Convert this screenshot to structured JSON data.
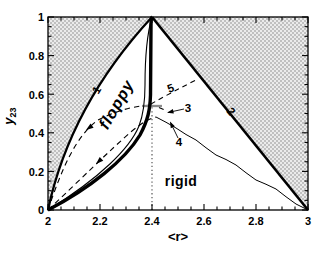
{
  "figure": {
    "xlabel": "<r>",
    "ylabel": {
      "base": "y",
      "sub": "23"
    },
    "x_ticks": [
      "2",
      "2.2",
      "2.4",
      "2.6",
      "2.8",
      "3"
    ],
    "y_ticks": [
      "1",
      "0.8",
      "0.6",
      "0.4",
      "0.2",
      "0"
    ],
    "regions": {
      "floppy": "floppy",
      "rigid": "rigid"
    },
    "curve_labels": {
      "c1": "1",
      "c2": "2",
      "c3": "3",
      "c4": "4",
      "c5": "5"
    }
  },
  "chart_data": {
    "type": "line",
    "title": "",
    "xlabel": "<r>",
    "ylabel": "y_23",
    "xlim": [
      2,
      3
    ],
    "ylim": [
      0,
      1
    ],
    "x_major_ticks": [
      2,
      2.2,
      2.4,
      2.6,
      2.8,
      3
    ],
    "y_major_ticks": [
      0,
      0.2,
      0.4,
      0.6,
      0.8,
      1
    ],
    "minor_tick_step": 0.05,
    "background": "stippled (dotted halftone) everywhere outside the triangular phase region",
    "regions": [
      {
        "label": "floppy",
        "at": [
          2.28,
          0.55
        ],
        "rotation_deg": -60
      },
      {
        "label": "rigid",
        "at": [
          2.52,
          0.16
        ],
        "rotation_deg": 0
      }
    ],
    "reference_line": {
      "style": "dotted-vertical",
      "x": 2.4,
      "y_from": 0,
      "y_to": 0.55
    },
    "series": [
      {
        "name": "1",
        "style": "thick solid boundary (left edge of stippled region)",
        "points": [
          [
            2.0,
            0
          ],
          [
            2.03,
            0.1
          ],
          [
            2.08,
            0.31
          ],
          [
            2.12,
            0.42
          ],
          [
            2.19,
            0.57
          ],
          [
            2.24,
            0.7
          ],
          [
            2.33,
            0.88
          ],
          [
            2.4,
            1.0
          ]
        ]
      },
      {
        "name": "2",
        "style": "thick solid boundary (right edge of stippled region)",
        "points": [
          [
            2.4,
            1.0
          ],
          [
            3.0,
            0
          ]
        ]
      },
      {
        "name": "transition-thick",
        "style": "heavy solid curve, becomes vertical near r=2.4",
        "points": [
          [
            2.0,
            0
          ],
          [
            2.09,
            0.06
          ],
          [
            2.16,
            0.13
          ],
          [
            2.24,
            0.21
          ],
          [
            2.3,
            0.28
          ],
          [
            2.33,
            0.35
          ],
          [
            2.37,
            0.41
          ],
          [
            2.38,
            0.47
          ],
          [
            2.39,
            0.55
          ],
          [
            2.39,
            0.78
          ],
          [
            2.4,
            1.0
          ]
        ]
      },
      {
        "name": "transition-thin",
        "style": "thin solid curve just left of heavy curve",
        "points": [
          [
            2.0,
            0
          ],
          [
            2.2,
            0.22
          ],
          [
            2.31,
            0.33
          ],
          [
            2.35,
            0.43
          ],
          [
            2.37,
            0.55
          ],
          [
            2.375,
            0.7
          ],
          [
            2.4,
            1.0
          ]
        ]
      },
      {
        "name": "3",
        "style": "dashed with arrowhead toward (2,0)",
        "points": [
          [
            2.0,
            0
          ],
          [
            2.15,
            0.32
          ],
          [
            2.27,
            0.48
          ],
          [
            2.35,
            0.53
          ],
          [
            2.4,
            0.545
          ],
          [
            2.46,
            0.51
          ]
        ]
      },
      {
        "name": "4",
        "style": "dashed with arrowhead, continues as thin wavy solid line to (3,0)",
        "points": [
          [
            2.0,
            0
          ],
          [
            2.19,
            0.24
          ],
          [
            2.33,
            0.43
          ],
          [
            2.42,
            0.48
          ],
          [
            2.66,
            0.3
          ],
          [
            2.82,
            0.17
          ],
          [
            3.0,
            0
          ]
        ]
      },
      {
        "name": "5",
        "style": "dashed branch rising to the right",
        "points": [
          [
            2.4,
            0.55
          ],
          [
            2.47,
            0.61
          ],
          [
            2.58,
            0.68
          ]
        ]
      }
    ],
    "annotations": [
      {
        "text": "1",
        "at": [
          2.2,
          0.61
        ],
        "rotation_deg": -58
      },
      {
        "text": "2",
        "at": [
          2.69,
          0.5
        ],
        "rotation_deg": 50
      },
      {
        "text": "3",
        "at": [
          2.53,
          0.52
        ],
        "arrow_to": [
          2.46,
          0.505
        ]
      },
      {
        "text": "4",
        "at": [
          2.5,
          0.34
        ],
        "arrow_to": [
          2.47,
          0.46
        ]
      },
      {
        "text": "5",
        "at": [
          2.47,
          0.62
        ],
        "rotation_deg": -20
      },
      {
        "text": "floppy",
        "at": [
          2.28,
          0.55
        ]
      },
      {
        "text": "rigid",
        "at": [
          2.52,
          0.16
        ]
      }
    ]
  }
}
